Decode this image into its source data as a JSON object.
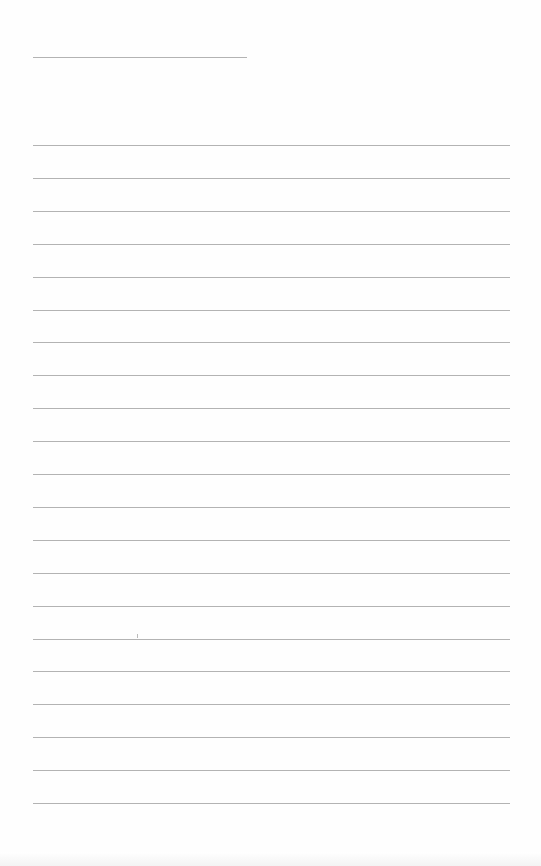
{
  "page": {
    "type": "lined-paper",
    "background": "#ffffff",
    "rule_color": "#9a9a9a",
    "header_line": {
      "x": 33,
      "y": 57,
      "width": 214
    },
    "lines": {
      "x": 33,
      "width": 477,
      "start_y": 145,
      "spacing": 32.9,
      "count": 21
    }
  }
}
